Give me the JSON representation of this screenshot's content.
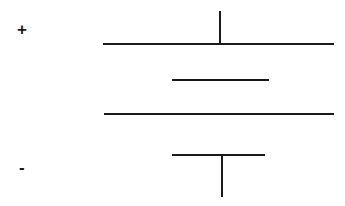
{
  "figure": {
    "background_color": "#ffffff",
    "stroke_color": "#1a1a1a",
    "width": 345,
    "height": 206
  },
  "labels": {
    "positive": "+",
    "negative": "-"
  },
  "icons": {
    "positive_terminal": "plus-sign",
    "negative_terminal": "minus-sign"
  },
  "chart_data": {
    "type": "diagram",
    "xlabel": "",
    "ylabel": "",
    "xlim": [
      0,
      345
    ],
    "ylim": [
      0,
      206
    ],
    "grid": false,
    "legend": null,
    "stroke_color": "#1a1a1a",
    "stroke_width": 2,
    "annotations": [
      {
        "text": "+",
        "x": 24,
        "y": 30,
        "name": "positive-terminal-label"
      },
      {
        "text": "-",
        "x": 25,
        "y": 168,
        "name": "negative-terminal-label"
      }
    ],
    "segments": [
      {
        "name": "positive-lead",
        "orientation": "vertical",
        "x1": 220,
        "y1": 11,
        "x2": 220,
        "y2": 45
      },
      {
        "name": "plate-1-long",
        "orientation": "horizontal",
        "x1": 103,
        "y1": 44,
        "x2": 334,
        "y2": 44
      },
      {
        "name": "plate-2-short",
        "orientation": "horizontal",
        "x1": 172,
        "y1": 80,
        "x2": 269,
        "y2": 80
      },
      {
        "name": "plate-3-long",
        "orientation": "horizontal",
        "x1": 104,
        "y1": 114,
        "x2": 334,
        "y2": 114
      },
      {
        "name": "plate-4-short",
        "orientation": "horizontal",
        "x1": 172,
        "y1": 155,
        "x2": 265,
        "y2": 155
      },
      {
        "name": "negative-lead",
        "orientation": "vertical",
        "x1": 222,
        "y1": 154,
        "x2": 222,
        "y2": 197
      }
    ]
  }
}
